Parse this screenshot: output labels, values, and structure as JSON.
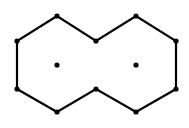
{
  "diagram": {
    "type": "graph",
    "colors": {
      "stroke": "#000000",
      "fill": "#000000",
      "background": "#ffffff"
    },
    "stroke_width": 2.2,
    "vertex_radius": 2.6,
    "vertices": [
      {
        "id": "top-left-peak",
        "x": 57,
        "y": 16
      },
      {
        "id": "left-upper",
        "x": 17,
        "y": 41
      },
      {
        "id": "left-lower",
        "x": 17,
        "y": 89
      },
      {
        "id": "bottom-left",
        "x": 57,
        "y": 112
      },
      {
        "id": "middle-bottom",
        "x": 96,
        "y": 89
      },
      {
        "id": "bottom-right",
        "x": 136,
        "y": 112
      },
      {
        "id": "right-lower",
        "x": 176,
        "y": 89
      },
      {
        "id": "right-upper",
        "x": 176,
        "y": 41
      },
      {
        "id": "top-right-peak",
        "x": 136,
        "y": 16
      },
      {
        "id": "middle-top",
        "x": 96,
        "y": 41
      },
      {
        "id": "center-left",
        "x": 57,
        "y": 65
      },
      {
        "id": "center-right",
        "x": 136,
        "y": 65
      }
    ],
    "outline_order": [
      "top-left-peak",
      "left-upper",
      "left-lower",
      "bottom-left",
      "middle-bottom",
      "bottom-right",
      "right-lower",
      "right-upper",
      "top-right-peak",
      "middle-top"
    ]
  }
}
